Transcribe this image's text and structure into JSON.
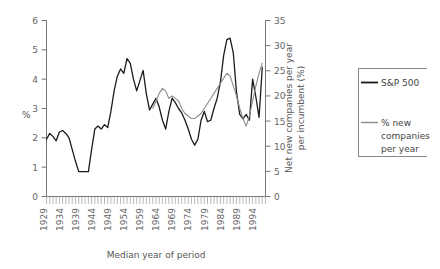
{
  "chart_data": {
    "type": "line",
    "title": "",
    "xlabel": "Median year of period",
    "ylabel": "%",
    "y2label": "Net new companies per year per incumbent (%)",
    "xlim": [
      1929,
      1997
    ],
    "ylim": [
      0,
      6
    ],
    "y2lim": [
      0,
      35
    ],
    "grid": false,
    "legend_position": "right",
    "xticks": [
      "1929",
      "1934",
      "1939",
      "1944",
      "1949",
      "1954",
      "1959",
      "1964",
      "1969",
      "1974",
      "1979",
      "1984",
      "1989",
      "1994"
    ],
    "yticks": [
      "0",
      "1",
      "2",
      "3",
      "4",
      "5",
      "6"
    ],
    "y2ticks": [
      "0",
      "5",
      "10",
      "15",
      "20",
      "25",
      "30",
      "35"
    ],
    "minor_tick_interval": 1,
    "series": [
      {
        "name": "S&P 500",
        "color": "#1b1b1b",
        "axis": "left",
        "x": [
          1929,
          1930,
          1931,
          1932,
          1933,
          1934,
          1935,
          1936,
          1937,
          1938,
          1939,
          1940,
          1941,
          1942,
          1943,
          1944,
          1945,
          1946,
          1947,
          1948,
          1949,
          1950,
          1951,
          1952,
          1953,
          1954,
          1955,
          1956,
          1957,
          1958,
          1959,
          1960,
          1961,
          1962,
          1963,
          1964,
          1965,
          1966,
          1967,
          1968,
          1969,
          1970,
          1971,
          1972,
          1973,
          1974,
          1975,
          1976,
          1977,
          1978,
          1979,
          1980,
          1981,
          1982,
          1983,
          1984,
          1985,
          1986,
          1987,
          1988,
          1989,
          1990,
          1991,
          1992,
          1993,
          1994,
          1995,
          1996
        ],
        "values": [
          1.95,
          2.15,
          2.05,
          1.9,
          2.2,
          2.25,
          2.15,
          2.0,
          1.6,
          1.2,
          0.85,
          0.85,
          0.85,
          0.85,
          1.6,
          2.3,
          2.4,
          2.3,
          2.45,
          2.35,
          2.9,
          3.6,
          4.1,
          4.35,
          4.2,
          4.7,
          4.55,
          4.0,
          3.6,
          3.95,
          4.3,
          3.5,
          2.95,
          3.15,
          3.35,
          3.05,
          2.6,
          2.3,
          2.9,
          3.35,
          3.2,
          3.0,
          2.85,
          2.6,
          2.3,
          1.95,
          1.75,
          1.95,
          2.05,
          2.0,
          2.05,
          2.1,
          2.05,
          2.2,
          2.65,
          3.2,
          3.7,
          4.0,
          3.9,
          3.75,
          3.55,
          3.8,
          3.6,
          3.3,
          3.05,
          2.9,
          2.75,
          2.85
        ]
      },
      {
        "name": "% new companies per year",
        "color": "#8c8c8c",
        "axis": "right",
        "x": [
          1962,
          1963,
          1964,
          1965,
          1966,
          1967,
          1968,
          1969,
          1970,
          1971,
          1972,
          1973,
          1974,
          1975,
          1976,
          1977,
          1978,
          1979,
          1980,
          1981,
          1982,
          1983,
          1984,
          1985,
          1986,
          1987,
          1988,
          1989,
          1990,
          1991,
          1992,
          1993,
          1994,
          1995,
          1996
        ],
        "values": [
          17.5,
          19.0,
          20.5,
          21.5,
          21.0,
          19.5,
          20.0,
          19.5,
          19.0,
          17.5,
          16.5,
          16.0,
          15.5,
          15.5,
          16.0,
          16.5,
          17.5,
          18.5,
          19.5,
          20.5,
          21.5,
          22.5,
          23.5,
          24.5,
          24.0,
          22.0,
          20.0,
          17.5,
          15.5,
          14.0,
          16.0,
          19.0,
          22.0,
          24.5,
          26.5
        ]
      }
    ],
    "series_late_primary": {
      "note": "black series continues with sharp peak near 1984-86 reaching 5.4 then dips to 2.6 and recovers to 3.4",
      "x": [
        1977,
        1978,
        1979,
        1980,
        1981,
        1982,
        1983,
        1984,
        1985,
        1986,
        1987,
        1988,
        1989,
        1990,
        1991,
        1992,
        1993,
        1994,
        1995,
        1996
      ],
      "values": [
        2.6,
        2.9,
        2.55,
        2.6,
        3.0,
        3.35,
        3.9,
        4.8,
        5.35,
        5.4,
        4.9,
        3.55,
        2.8,
        2.65,
        2.8,
        2.6,
        4.0,
        3.4,
        2.7,
        4.4
      ]
    }
  },
  "legend": {
    "entries": [
      {
        "label": "S&P 500",
        "color": "#1b1b1b"
      },
      {
        "label": "% new companies per year",
        "color": "#8c8c8c"
      }
    ],
    "entry1_label": "S&P 500",
    "entry2_line1": "% new",
    "entry2_line2": "companies",
    "entry2_line3": "per year"
  },
  "axes": {
    "left_title": "%",
    "bottom_title": "Median year of period",
    "right_title_line1": "Net new companies per year",
    "right_title_line2": "per incumbent (%)"
  }
}
